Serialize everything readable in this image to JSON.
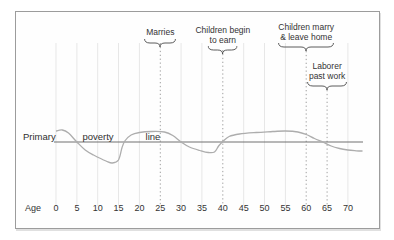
{
  "chart_data": {
    "type": "line",
    "xlabel": "Age",
    "x_ticks": [
      0,
      5,
      10,
      15,
      20,
      25,
      30,
      35,
      40,
      45,
      50,
      55,
      60,
      65,
      70
    ],
    "xlim": [
      0,
      74
    ],
    "grid": "faint vertical line at every 5-year tick; dotted vertical lines at event ages",
    "poverty_line_labels": {
      "left": "Primary",
      "mid": "poverty",
      "right": "line"
    },
    "events": [
      {
        "age": 25,
        "lines": [
          "Marries"
        ]
      },
      {
        "age": 40,
        "lines": [
          "Children begin",
          "to earn"
        ]
      },
      {
        "age": 60,
        "lines": [
          "Children marry",
          "& leave home"
        ]
      },
      {
        "age": 65,
        "lines": [
          "Laborer",
          "past work"
        ]
      }
    ],
    "y_meaning": "relative units; 0 = primary poverty line, positive = above the line",
    "series": [
      {
        "name": "income relative to primary poverty line",
        "points": [
          [
            0,
            11
          ],
          [
            1.5,
            12
          ],
          [
            3,
            9
          ],
          [
            5,
            0
          ],
          [
            7,
            -8
          ],
          [
            9,
            -13
          ],
          [
            12,
            -19
          ],
          [
            13.5,
            -21
          ],
          [
            15,
            -18
          ],
          [
            15.8,
            -6
          ],
          [
            16.5,
            1
          ],
          [
            18,
            7
          ],
          [
            20,
            9.5
          ],
          [
            23,
            10.5
          ],
          [
            26,
            10
          ],
          [
            28,
            6.5
          ],
          [
            30,
            0
          ],
          [
            32,
            -5
          ],
          [
            34.5,
            -8.5
          ],
          [
            36.5,
            -10.5
          ],
          [
            38,
            -10
          ],
          [
            39,
            -4
          ],
          [
            40,
            0.5
          ],
          [
            41.5,
            5.5
          ],
          [
            44,
            8
          ],
          [
            48,
            9.5
          ],
          [
            52,
            10.5
          ],
          [
            55,
            11
          ],
          [
            58,
            10
          ],
          [
            60,
            7.5
          ],
          [
            62,
            3.5
          ],
          [
            64,
            0
          ],
          [
            66,
            -4
          ],
          [
            68,
            -6.5
          ],
          [
            70,
            -8
          ],
          [
            72,
            -8.8
          ],
          [
            73.5,
            -9
          ]
        ]
      }
    ],
    "colors": {
      "curve": "#adadad",
      "poverty_line": "#707070",
      "event_gridline": "#9f9f9f",
      "faint_gridline": "#e7e7e7",
      "text": "#333333",
      "frame_border": "#9c9c9c"
    }
  }
}
